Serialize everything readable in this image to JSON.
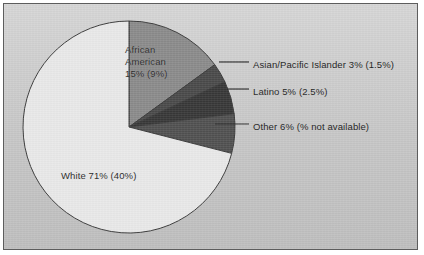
{
  "chart_data": {
    "type": "pie",
    "title": "",
    "subtitle": "",
    "xlabel": "",
    "ylabel": "",
    "legend_position": "none",
    "grid": false,
    "start_angle_deg": 0,
    "direction": "clockwise",
    "categories": [
      "African American",
      "Asian/Pacific Islander",
      "Latino",
      "Other",
      "White"
    ],
    "values": [
      15,
      3,
      5,
      6,
      71
    ],
    "secondary_values": [
      9,
      1.5,
      2.5,
      null,
      40
    ],
    "value_unit": "%",
    "slices": [
      {
        "name": "African American",
        "label": "African American 15% (9%)",
        "label_lines": [
          "African",
          "American",
          "15% (9%)"
        ],
        "value": 15,
        "value_text": "15%",
        "secondary_text": "(9%)",
        "color": "#8b8b8b",
        "label_placement": "inside"
      },
      {
        "name": "Asian/Pacific Islander",
        "label": "Asian/Pacific Islander 3% (1.5%)",
        "value": 3,
        "value_text": "3%",
        "secondary_text": "(1.5%)",
        "color": "#4a4a4a",
        "label_placement": "callout"
      },
      {
        "name": "Latino",
        "label": "Latino 5% (2.5%)",
        "value": 5,
        "value_text": "5%",
        "secondary_text": "(2.5%)",
        "color": "#383838",
        "label_placement": "callout"
      },
      {
        "name": "Other",
        "label": "Other 6% (% not available)",
        "value": 6,
        "value_text": "6%",
        "secondary_text": "(% not available)",
        "color": "#515151",
        "label_placement": "callout"
      },
      {
        "name": "White",
        "label": "White 71% (40%)",
        "value": 71,
        "value_text": "71%",
        "secondary_text": "(40%)",
        "color": "#e9e9e9",
        "label_placement": "inside"
      }
    ]
  },
  "colors": {
    "panel_background": "#cdcdcd",
    "panel_border": "#5d5d5d",
    "outline": "#3c3c3c",
    "text": "#242424",
    "leader_line": "#2e2e2e"
  },
  "labels": {
    "african_american_line1": "African",
    "african_american_line2": "American",
    "african_american_line3": "15% (9%)",
    "white": "White 71% (40%)",
    "asian": "Asian/Pacific Islander 3% (1.5%)",
    "latino": "Latino 5% (2.5%)",
    "other": "Other 6% (% not available)"
  }
}
